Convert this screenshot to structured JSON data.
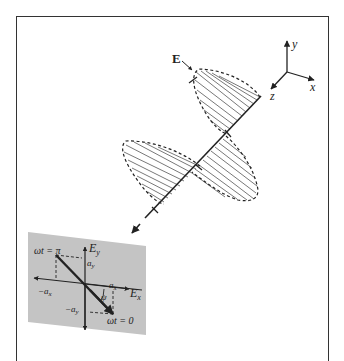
{
  "figure": {
    "field_label": "E",
    "axes": {
      "x": "x",
      "y": "y",
      "z": "z"
    },
    "inset": {
      "ex_axis": "E",
      "ex_sub": "x",
      "ey_axis": "E",
      "ey_sub": "y",
      "top_label": "ωt = π",
      "bottom_label": "ωt = 0",
      "ay": "a",
      "ay_sub": "y",
      "neg_ay": "−a",
      "neg_ay_sub": "y",
      "ax": "a",
      "ax_sub": "x",
      "neg_ax": "−a",
      "neg_ax_sub": "x",
      "angle": "ψ"
    }
  },
  "colors": {
    "ink": "#222222",
    "inset_bg": "#c4c4c4",
    "frame": "#333333"
  }
}
